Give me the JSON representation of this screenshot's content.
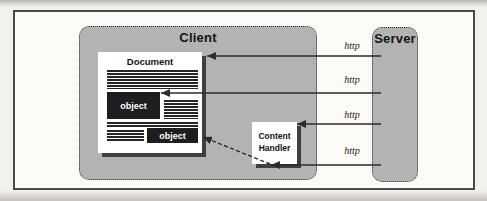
{
  "diagram": {
    "client": {
      "title": "Client"
    },
    "server": {
      "title": "Server"
    },
    "document": {
      "title": "Document",
      "objects": [
        {
          "label": "object"
        },
        {
          "label": "object"
        }
      ]
    },
    "content_handler": {
      "line1": "Content",
      "line2": "Handler"
    },
    "arrows": [
      {
        "label": "http",
        "from": "server",
        "to": "document"
      },
      {
        "label": "http",
        "from": "server",
        "to": "document-object-1"
      },
      {
        "label": "http",
        "from": "server",
        "to": "content-handler"
      },
      {
        "label": "http",
        "from": "server",
        "to": "content-handler"
      }
    ],
    "dashed_link": {
      "from": "content-handler",
      "to": "document-object-2",
      "style": "dashed"
    },
    "colors": {
      "panel_gray": "#b3b3b3",
      "object_dark": "#1e1e1e",
      "shadow_dark": "#3f3f3f",
      "arrow": "#2b2b2b",
      "frame_border": "#4a4a48",
      "paper": "#fcfbf8"
    }
  }
}
